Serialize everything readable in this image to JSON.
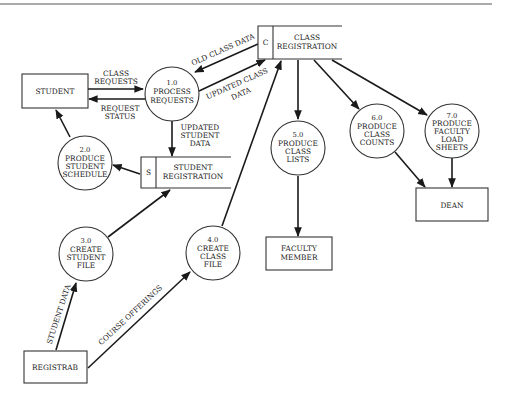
{
  "diagram": {
    "type": "data-flow-diagram",
    "entities": {
      "student": "STUDENT",
      "faculty_member": [
        "FACULTY",
        "MEMBER"
      ],
      "dean": "DEAN",
      "registrar": "REGISTRAB"
    },
    "data_stores": {
      "class_registration": {
        "id": "C",
        "name": [
          "CLASS",
          "REGISTRATION"
        ]
      },
      "student_registration": {
        "id": "S",
        "name": [
          "STUDENT",
          "REGISTRATION"
        ]
      }
    },
    "processes": {
      "p1": {
        "number": "1.0",
        "name": [
          "PROCESS",
          "REQUESTS"
        ]
      },
      "p2": {
        "number": "2.0",
        "name": [
          "PRODUCE",
          "STUDENT",
          "SCHEDULE"
        ]
      },
      "p3": {
        "number": "3.0",
        "name": [
          "CREATE",
          "STUDENT",
          "FILE"
        ]
      },
      "p4": {
        "number": "4.0",
        "name": [
          "CREATE",
          "CLASS",
          "FILE"
        ]
      },
      "p5": {
        "number": "5.0",
        "name": [
          "PRODUCE",
          "CLASS",
          "LISTS"
        ]
      },
      "p6": {
        "number": "6.0",
        "name": [
          "PRODUCE",
          "CLASS",
          "COUNTS"
        ]
      },
      "p7": {
        "number": "7.0",
        "name": [
          "PRODUCE",
          "FACULTY",
          "LOAD",
          "SHEETS"
        ]
      }
    },
    "flows": {
      "class_requests": [
        "CLASS",
        "REQUESTS"
      ],
      "request_status": [
        "REQUEST",
        "STATUS"
      ],
      "old_class_data": "OLD CLASS DATA",
      "updated_class_data": [
        "UPDATED CLASS",
        "DATA"
      ],
      "updated_student_data": [
        "UPDATED",
        "STUDENT",
        "DATA"
      ],
      "student_data": "STUDENT DATA",
      "course_offerings": "COURSE OFFERINGS"
    }
  }
}
